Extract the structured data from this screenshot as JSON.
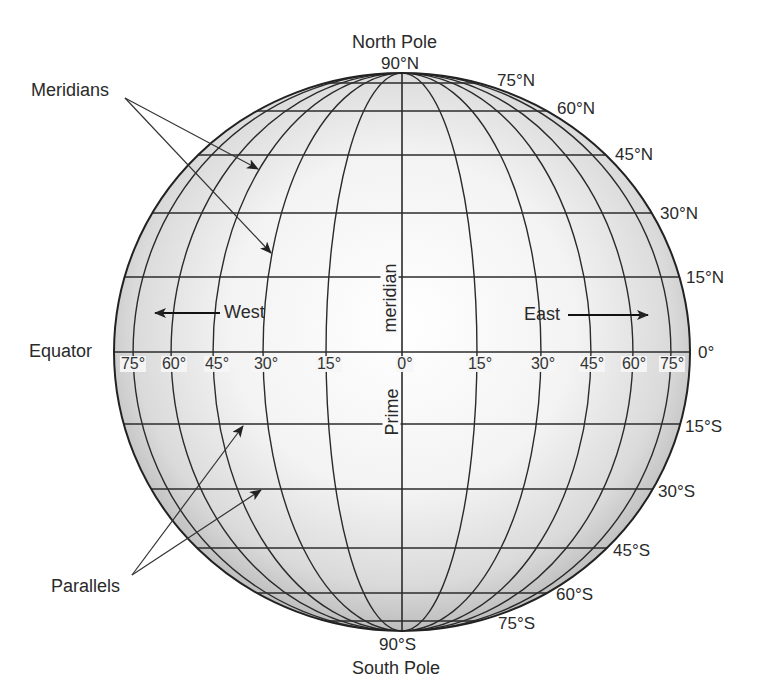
{
  "diagram": {
    "title_clipped": "",
    "callouts": {
      "meridians": "Meridians",
      "parallels": "Parallels",
      "equator": "Equator",
      "prime_meridian_top": "meridian",
      "prime_meridian_bottom": "Prime"
    },
    "poles": {
      "north_name": "North Pole",
      "north_lat": "90°N",
      "south_name": "South Pole",
      "south_lat": "90°S"
    },
    "directions": {
      "west": "West",
      "east": "East"
    },
    "latitude_labels": {
      "n75": "75°N",
      "n60": "60°N",
      "n45": "45°N",
      "n30": "30°N",
      "n15": "15°N",
      "eq": "0°",
      "s15": "15°S",
      "s30": "30°S",
      "s45": "45°S",
      "s60": "60°S",
      "s75": "75°S"
    },
    "longitude_labels": {
      "w75": "75°",
      "w60": "60°",
      "w45": "45°",
      "w30": "30°",
      "w15": "15°",
      "zero": "0°",
      "e15": "15°",
      "e30": "30°",
      "e45": "45°",
      "e60": "60°",
      "e75": "75°"
    },
    "colors": {
      "line": "#2b2b2b",
      "globe_center": "#ffffff",
      "globe_edge": "#bdbdbd",
      "text": "#2a2a2a"
    }
  }
}
